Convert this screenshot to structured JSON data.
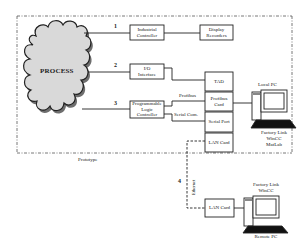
{
  "diagram": {
    "process": {
      "label": "PROCESS"
    },
    "links": [
      {
        "number": "1"
      },
      {
        "number": "2"
      },
      {
        "number": "3"
      },
      {
        "number": "4"
      }
    ],
    "boxes": {
      "industrial_controller": {
        "line1": "Industrial",
        "line2": "Controller"
      },
      "display_recorders": {
        "line1": "Display",
        "line2": "Recorders"
      },
      "io_interface": {
        "line1": "I/O",
        "line2": "Interface"
      },
      "plc": {
        "line1": "Programmable",
        "line2": "Logic",
        "line3": "Controller"
      },
      "tad": {
        "label": "TAD"
      },
      "profibus_card": {
        "line1": "Profibus",
        "line2": "Card"
      },
      "serial_port": {
        "label": "Serial Port"
      },
      "lan_card_local": {
        "label": "LAN Card"
      },
      "lan_card_remote": {
        "label": "LAN Card"
      }
    },
    "connection_labels": {
      "profibus": "Profibus",
      "serial_com": "Serial Com.",
      "ethernet": "Ethernet"
    },
    "local_pc": {
      "title": "Local PC",
      "software": [
        "Factory Link",
        "WinCC",
        "MatLab"
      ]
    },
    "remote_pc": {
      "title": "Remote PC",
      "software": [
        "Factory Link",
        "WinCC"
      ]
    },
    "prototype_label": "Prototype"
  }
}
